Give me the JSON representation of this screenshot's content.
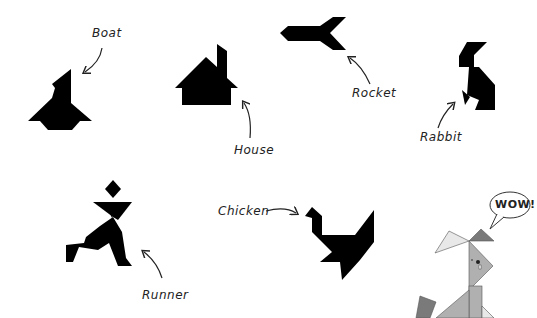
{
  "figure": {
    "background": "#ffffff",
    "silhouette_color": "#000000",
    "shapes": [
      {
        "id": "boat",
        "label": "Boat"
      },
      {
        "id": "house",
        "label": "House"
      },
      {
        "id": "rocket",
        "label": "Rocket"
      },
      {
        "id": "rabbit",
        "label": "Rabbit"
      },
      {
        "id": "runner",
        "label": "Runner"
      },
      {
        "id": "chicken",
        "label": "Chicken"
      }
    ],
    "mascot": {
      "speech": "WOW!",
      "colors": {
        "light": "#e8e8e8",
        "mid": "#b0b0b0",
        "dark": "#7a7a7a"
      }
    }
  }
}
